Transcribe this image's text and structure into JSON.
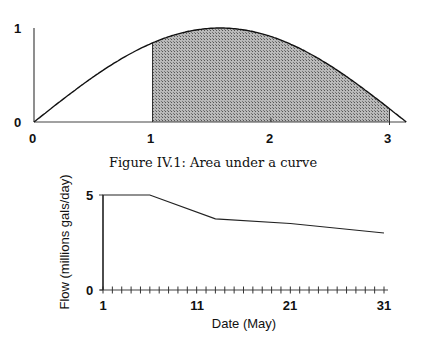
{
  "chart_data": [
    {
      "type": "area",
      "title": "",
      "caption": "Figure IV.1:  Area under a curve",
      "function": "sin(x)",
      "x_range": [
        0,
        3.1416
      ],
      "shaded_interval": [
        1,
        3
      ],
      "xlabel": "",
      "ylabel": "",
      "x_ticks": [
        "0",
        "1",
        "2",
        "3"
      ],
      "y_ticks": [
        "0",
        "1"
      ],
      "ylim": [
        0,
        1
      ],
      "grid": false,
      "legend": null
    },
    {
      "type": "line",
      "title": "",
      "xlabel": "Date (May)",
      "ylabel": "Flow (millions gals/day)",
      "x": [
        1,
        6,
        13,
        21,
        31
      ],
      "values": [
        5,
        5,
        3.75,
        3.5,
        3.0
      ],
      "x_ticks": [
        "1",
        "11",
        "21",
        "31"
      ],
      "y_ticks": [
        "0",
        "5"
      ],
      "xlim": [
        1,
        31
      ],
      "ylim": [
        0,
        5
      ],
      "minor_ticks_every": 1,
      "grid": false,
      "legend": null
    }
  ],
  "top": {
    "x_ticks": [
      "0",
      "1",
      "2",
      "3"
    ],
    "y_ticks": [
      "0",
      "1"
    ]
  },
  "caption": "Figure IV.1:  Area under a curve",
  "bottom": {
    "x_ticks": [
      "1",
      "11",
      "21",
      "31"
    ],
    "y_ticks": [
      "0",
      "5"
    ],
    "xlabel": "Date (May)",
    "ylabel": "Flow (millions gals/day)"
  }
}
